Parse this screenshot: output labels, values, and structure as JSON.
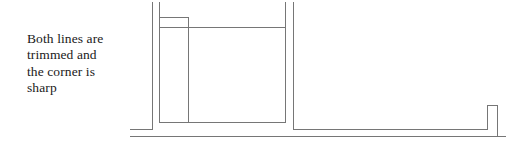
{
  "canvas": {
    "width": 521,
    "height": 148,
    "background": "#ffffff"
  },
  "caption": {
    "text": "Both lines are\ntrimmed and\nthe corner is\nsharp",
    "lines": [
      "Both lines are",
      "trimmed and",
      "the corner is",
      "sharp"
    ],
    "color": "#1a1a1a",
    "font_size_px": 13.5
  },
  "diagram": {
    "name": "trimmed-corner-drawing",
    "stroke_color": "#767676",
    "stroke_width": 1,
    "paths": {
      "outer_wall": "M 152.5,2 L 152.5,129.5 L 130,129.5",
      "inner_wall": "M 159.5,2 L 159.5,17.5 L 188.5,17.5",
      "inner_step": "M 159.5,17.5 L 159.5,122.5 L 188.5,122.5",
      "vertical_divider": "M 188.5,17.5 L 188.5,122.5",
      "long_top_rail": "M 159.5,27.5 L 285.5,27.5",
      "inner_bottom_rail": "M 159.5,122.5 L 285.5,122.5",
      "right_inner_post": "M 285.5,2 L 285.5,122.5",
      "right_outer_post": "M 293.5,2 L 293.5,129.5",
      "bottom_outer_rail": "M 130,136.5 L 506,136.5",
      "bottom_inner_rail": "M 293.5,129.5 L 487.5,129.5",
      "right_notch": "M 487.5,129.5 L 487.5,105.5 L 497.5,105.5 L 497.5,136.5"
    }
  }
}
